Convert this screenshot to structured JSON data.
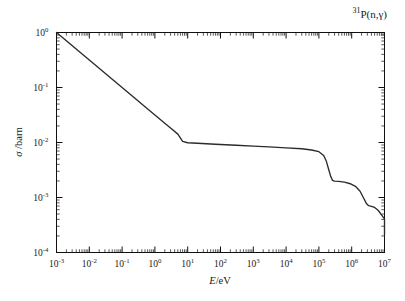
{
  "figure": {
    "title_prefix": "31",
    "title_main": "P(n,γ)",
    "title_plain": "31P(n,gamma)",
    "background": "#ffffff",
    "curve_color": "#2b2b2b",
    "axis_color": "#111111"
  },
  "chart_data": {
    "type": "line",
    "title": "31P(n,γ)",
    "xlabel": "E/eV",
    "ylabel": "σ /barn",
    "xscale": "log",
    "yscale": "log",
    "xlim": [
      0.001,
      10000000
    ],
    "ylim": [
      0.0001,
      1
    ],
    "grid": false,
    "legend": null,
    "xticklabels": [
      "10-3",
      "10-2",
      "10-1",
      "100",
      "101",
      "102",
      "103",
      "104",
      "105",
      "106",
      "107"
    ],
    "xtick_bases": [
      "10",
      "10",
      "10",
      "10",
      "10",
      "10",
      "10",
      "10",
      "10",
      "10",
      "10"
    ],
    "xtick_exponents": [
      "-3",
      "-2",
      "-1",
      "0",
      "1",
      "2",
      "3",
      "4",
      "5",
      "6",
      "7"
    ],
    "ytick_bases": [
      "10",
      "10",
      "10",
      "10",
      "10"
    ],
    "ytick_exponents": [
      "0",
      "-1",
      "-2",
      "-3",
      "-4"
    ],
    "series": [
      {
        "name": "capture cross section",
        "x": [
          0.001,
          0.002,
          0.005,
          0.01,
          0.02,
          0.05,
          0.1,
          0.2,
          0.5,
          1.0,
          2.0,
          3.0,
          5.0,
          7.0,
          10,
          20,
          50,
          100,
          300,
          1000,
          3000,
          10000,
          30000,
          60000,
          100000,
          140000,
          170000,
          200000,
          230000,
          260000,
          300000,
          400000,
          600000,
          900000,
          1300000,
          1800000,
          2300000,
          2800000,
          3300000,
          4000000,
          5000000,
          6500000,
          8000000,
          10000000,
          13000000,
          16000000,
          20000000
        ],
        "y": [
          1.0,
          0.707,
          0.447,
          0.316,
          0.224,
          0.141,
          0.1,
          0.0707,
          0.0447,
          0.0316,
          0.0224,
          0.0183,
          0.0142,
          0.0105,
          0.0099,
          0.0097,
          0.0094,
          0.0092,
          0.0089,
          0.0086,
          0.0083,
          0.008,
          0.0077,
          0.0073,
          0.0068,
          0.0058,
          0.0045,
          0.0032,
          0.0024,
          0.00205,
          0.00198,
          0.00196,
          0.0019,
          0.00178,
          0.0016,
          0.0013,
          0.00098,
          0.00078,
          0.00071,
          0.00069,
          0.00066,
          0.00058,
          0.00049,
          0.00041,
          0.00032,
          0.00026,
          0.00021
        ]
      }
    ],
    "features": [
      {
        "name": "1/v region",
        "range": [
          0.001,
          7
        ],
        "slope": -0.5
      },
      {
        "name": "plateau",
        "range": [
          7,
          100000
        ],
        "value": 0.0095
      },
      {
        "name": "step-1 drop",
        "range": [
          100000,
          300000
        ],
        "to": 0.002
      },
      {
        "name": "step-2 drop",
        "range": [
          900000,
          3300000
        ],
        "to": 0.0007
      },
      {
        "name": "step-3 decline",
        "range": [
          5000000,
          20000000
        ],
        "to": 0.0002
      }
    ]
  }
}
